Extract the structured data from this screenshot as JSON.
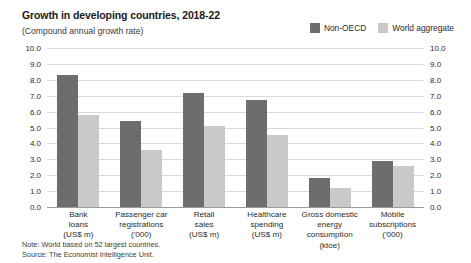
{
  "header": {
    "title": "Growth in developing countries, 2018-22",
    "subtitle": "(Compound annual growth rate)"
  },
  "legend": {
    "position": "top-right",
    "items": [
      {
        "label": "Non-OECD",
        "color": "#6d6d6d",
        "swatch": "legend-swatch-non-oecd"
      },
      {
        "label": "World aggregate",
        "color": "#c9c9c9",
        "swatch": "legend-swatch-world"
      }
    ]
  },
  "axis": {
    "ticks": [
      "10.0",
      "9.0",
      "8.0",
      "7.0",
      "6.0",
      "5.0",
      "4.0",
      "3.0",
      "2.0",
      "1.0",
      "0.0"
    ]
  },
  "categories": [
    {
      "name": "Bank loans",
      "line1": "Bank",
      "line2": "loans",
      "unit": "(US$ m)"
    },
    {
      "name": "Passenger car registrations",
      "line1": "Passenger car",
      "line2": "registrations",
      "unit": "('000)"
    },
    {
      "name": "Retail sales",
      "line1": "Retail",
      "line2": "sales",
      "unit": "(US$ m)"
    },
    {
      "name": "Healthcare spending",
      "line1": "Healthcare",
      "line2": "spending",
      "unit": "(US$ m)"
    },
    {
      "name": "Gross domestic energy consumption",
      "line1": "Gross domestic",
      "line2": "energy consumption",
      "unit": "(ktoe)"
    },
    {
      "name": "Mobile subscriptions",
      "line1": "Mobile",
      "line2": "subscriptions",
      "unit": "('000)"
    }
  ],
  "footnotes": {
    "note": "Note: World based on 52 largest countries.",
    "source": "Source: The Economist Intelligence Unit."
  },
  "chart_data": {
    "type": "bar",
    "title": "Growth in developing countries, 2018-22",
    "subtitle": "(Compound annual growth rate)",
    "xlabel": "",
    "ylabel": "",
    "ylim": [
      0,
      10
    ],
    "ytick_step": 1,
    "grid": true,
    "legend_position": "top-right",
    "categories": [
      "Bank loans (US$ m)",
      "Passenger car registrations ('000)",
      "Retail sales (US$ m)",
      "Healthcare spending (US$ m)",
      "Gross domestic energy consumption (ktoe)",
      "Mobile subscriptions ('000)"
    ],
    "series": [
      {
        "name": "Non-OECD",
        "color": "#6d6d6d",
        "values": [
          8.3,
          5.4,
          7.2,
          6.7,
          1.8,
          2.9
        ]
      },
      {
        "name": "World aggregate",
        "color": "#c9c9c9",
        "values": [
          5.8,
          3.6,
          5.1,
          4.5,
          1.2,
          2.6
        ]
      }
    ],
    "note": "Note: World based on 52 largest countries.",
    "source": "Source: The Economist Intelligence Unit."
  }
}
